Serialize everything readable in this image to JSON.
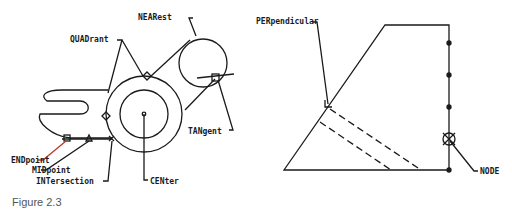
{
  "caption": "Figure 2.3",
  "colors": {
    "line": "#1a1a1a",
    "caption": "#555555",
    "endpoint_leader": "#c0392b"
  },
  "left_drawing": {
    "labels": {
      "nearest": "NEARest",
      "quadrant": "QUADrant",
      "tangent": "TANgent",
      "endpoint": "ENDpoint",
      "midpoint": "MIDpoint",
      "intersection": "INTersection",
      "center": "CENter"
    }
  },
  "right_drawing": {
    "labels": {
      "perpendicular": "PERpendicular",
      "node": "NODE"
    }
  }
}
